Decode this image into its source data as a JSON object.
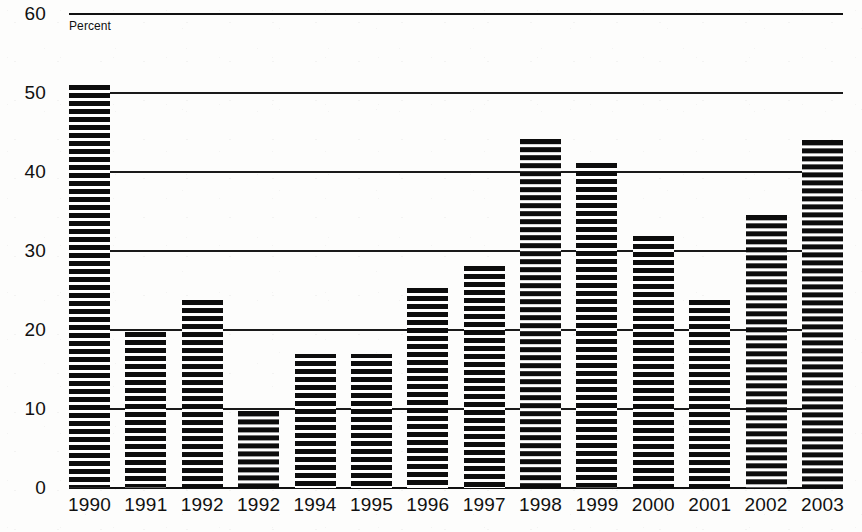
{
  "chart_data": {
    "type": "bar",
    "title": "",
    "subtitle": "",
    "axis_note": "Percent",
    "xlabel": "",
    "ylabel": "Percent",
    "ylim": [
      0,
      60
    ],
    "ytick_values": [
      60,
      50,
      40,
      30,
      20,
      10,
      0
    ],
    "ytick_labels": [
      "60",
      "50",
      "40",
      "30",
      "20",
      "10",
      "0"
    ],
    "grid": true,
    "grid_axis": "y",
    "legend": null,
    "legend_position": "none",
    "bar_style": "horizontal-hatch",
    "bar_color": "#0d0d0d",
    "categories": [
      "1990",
      "1991",
      "1992",
      "1992",
      "1994",
      "1995",
      "1996",
      "1997",
      "1998",
      "1999",
      "2000",
      "2001",
      "2002",
      "2003"
    ],
    "values": [
      51,
      19.7,
      23.8,
      9.8,
      16.9,
      16.9,
      25.3,
      28.1,
      44.2,
      41.1,
      31.9,
      23.8,
      34.6,
      44.1
    ],
    "series": [
      {
        "name": "Percent",
        "values": [
          51,
          19.7,
          23.8,
          9.8,
          16.9,
          16.9,
          25.3,
          28.1,
          44.2,
          41.1,
          31.9,
          23.8,
          34.6,
          44.1
        ]
      }
    ]
  },
  "colors": {
    "bar": "#0d0d0d",
    "grid": "#1a1a1a",
    "text": "#111111",
    "background": "#fdfdfc"
  }
}
